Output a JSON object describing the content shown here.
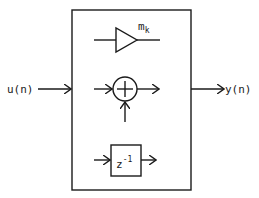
{
  "diagram": {
    "input_label": "u(n)",
    "output_label": "y(n)",
    "container": {
      "description": "block containing elementary building blocks"
    },
    "blocks": [
      {
        "type": "multiplier",
        "symbol": "triangle",
        "label_main": "m",
        "label_sub": "k"
      },
      {
        "type": "adder",
        "symbol": "circle-plus"
      },
      {
        "type": "delay",
        "symbol": "box",
        "label_main": "z",
        "label_sup": "-1"
      }
    ],
    "colors": {
      "stroke": "#1a1a1a",
      "background": "#ffffff"
    }
  }
}
